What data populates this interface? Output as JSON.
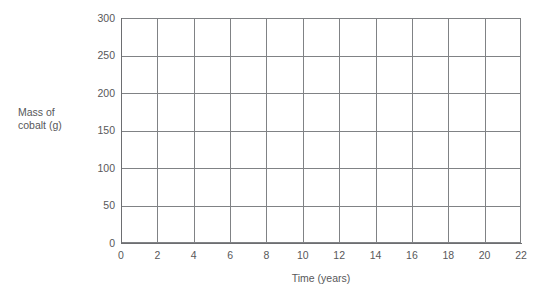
{
  "chart_data": {
    "type": "line",
    "title": "",
    "subtitle": "",
    "xlabel": "Time (years)",
    "ylabel_lines": [
      "Mass of",
      "cobalt (g)"
    ],
    "ylabel": "Mass of cobalt (g)",
    "xlim": [
      0,
      22
    ],
    "ylim": [
      0,
      300
    ],
    "x_tick_step": 2,
    "y_tick_step": 50,
    "xticks": [
      0,
      2,
      4,
      6,
      8,
      10,
      12,
      14,
      16,
      18,
      20,
      22
    ],
    "yticks": [
      0,
      50,
      100,
      150,
      200,
      250,
      300
    ],
    "xtick_labels": [
      "0",
      "2",
      "4",
      "6",
      "8",
      "10",
      "12",
      "14",
      "16",
      "18",
      "20",
      "22"
    ],
    "ytick_labels": [
      "0",
      "50",
      "100",
      "150",
      "200",
      "250",
      "300"
    ],
    "grid": true,
    "grid_color": "#808285",
    "axis_color": "#6d6e71",
    "text_color": "#58585a",
    "background": "#ffffff",
    "legend": null,
    "legend_position": "none",
    "annotations": [],
    "series": [],
    "values": [],
    "note": "Empty plotting grid: no data series drawn"
  }
}
